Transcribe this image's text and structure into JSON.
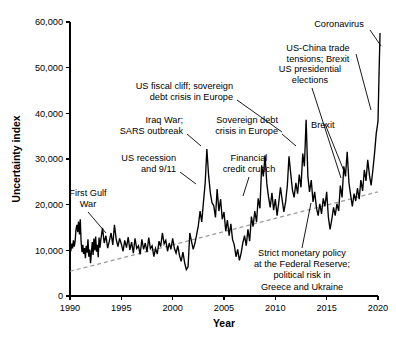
{
  "chart_data": {
    "type": "line",
    "title": "",
    "xlabel": "Year",
    "ylabel": "Uncertainty index",
    "xlim": [
      1990,
      2020
    ],
    "ylim": [
      0,
      60000
    ],
    "grid": false,
    "legend_position": "none",
    "x_ticks": [
      "1990",
      "1995",
      "2000",
      "2005",
      "2010",
      "2015",
      "2020"
    ],
    "y_ticks": [
      "0",
      "10,000",
      "20,000",
      "30,000",
      "40,000",
      "50,000",
      "60,000"
    ],
    "series": [
      {
        "name": "Uncertainty index",
        "style": "solid-black",
        "x": [
          1990.0,
          1990.08,
          1990.17,
          1990.25,
          1990.33,
          1990.42,
          1990.5,
          1990.58,
          1990.67,
          1990.75,
          1990.83,
          1990.92,
          1991.0,
          1991.08,
          1991.17,
          1991.25,
          1991.33,
          1991.42,
          1991.5,
          1991.58,
          1991.67,
          1991.75,
          1991.83,
          1991.92,
          1992.0,
          1992.08,
          1992.17,
          1992.25,
          1992.33,
          1992.42,
          1992.5,
          1992.58,
          1992.67,
          1992.75,
          1992.83,
          1992.92,
          1993.0,
          1993.17,
          1993.33,
          1993.5,
          1993.67,
          1993.83,
          1994.0,
          1994.17,
          1994.33,
          1994.5,
          1994.67,
          1994.83,
          1995.0,
          1995.17,
          1995.33,
          1995.5,
          1995.67,
          1995.83,
          1996.0,
          1996.17,
          1996.33,
          1996.5,
          1996.67,
          1996.83,
          1997.0,
          1997.17,
          1997.33,
          1997.5,
          1997.67,
          1997.83,
          1998.0,
          1998.17,
          1998.33,
          1998.5,
          1998.67,
          1998.83,
          1999.0,
          1999.17,
          1999.33,
          1999.5,
          1999.67,
          1999.83,
          2000.0,
          2000.17,
          2000.33,
          2000.5,
          2000.67,
          2000.83,
          2001.0,
          2001.17,
          2001.33,
          2001.5,
          2001.67,
          2001.83,
          2002.0,
          2002.17,
          2002.33,
          2002.5,
          2002.67,
          2002.83,
          2003.0,
          2003.17,
          2003.33,
          2003.5,
          2003.67,
          2003.83,
          2004.0,
          2004.17,
          2004.33,
          2004.5,
          2004.67,
          2004.83,
          2005.0,
          2005.17,
          2005.33,
          2005.5,
          2005.67,
          2005.83,
          2006.0,
          2006.17,
          2006.33,
          2006.5,
          2006.67,
          2006.83,
          2007.0,
          2007.17,
          2007.33,
          2007.5,
          2007.67,
          2007.83,
          2008.0,
          2008.17,
          2008.33,
          2008.5,
          2008.67,
          2008.83,
          2009.0,
          2009.17,
          2009.33,
          2009.5,
          2009.67,
          2009.83,
          2010.0,
          2010.17,
          2010.33,
          2010.5,
          2010.67,
          2010.83,
          2011.0,
          2011.17,
          2011.33,
          2011.5,
          2011.67,
          2011.83,
          2012.0,
          2012.17,
          2012.33,
          2012.5,
          2012.67,
          2012.83,
          2013.0,
          2013.17,
          2013.33,
          2013.5,
          2013.67,
          2013.83,
          2014.0,
          2014.17,
          2014.33,
          2014.5,
          2014.67,
          2014.83,
          2015.0,
          2015.17,
          2015.33,
          2015.5,
          2015.67,
          2015.83,
          2016.0,
          2016.17,
          2016.33,
          2016.5,
          2016.67,
          2016.83,
          2017.0,
          2017.17,
          2017.33,
          2017.5,
          2017.67,
          2017.83,
          2018.0,
          2018.17,
          2018.33,
          2018.5,
          2018.67,
          2018.83,
          2019.0,
          2019.17,
          2019.33,
          2019.5,
          2019.67,
          2019.83,
          2020.0,
          2020.1,
          2020.2
        ],
        "values": [
          11200,
          9800,
          11500,
          10400,
          12200,
          10800,
          12000,
          14500,
          15600,
          14000,
          16300,
          13500,
          16800,
          12000,
          9600,
          11200,
          9200,
          10500,
          8300,
          11000,
          9500,
          12400,
          8600,
          10200,
          7200,
          9400,
          11800,
          9000,
          12600,
          10000,
          13000,
          9700,
          11200,
          8500,
          12800,
          10600,
          12300,
          14900,
          11600,
          13200,
          10500,
          12000,
          13800,
          11200,
          15600,
          12400,
          10800,
          12600,
          11400,
          9800,
          12200,
          10600,
          12900,
          10100,
          11800,
          9400,
          12600,
          10400,
          11000,
          9100,
          12400,
          10200,
          11600,
          9600,
          12800,
          10400,
          11000,
          8600,
          10400,
          9200,
          12000,
          10800,
          13800,
          11400,
          12200,
          9800,
          11600,
          10200,
          12600,
          10400,
          9400,
          11000,
          8800,
          7600,
          9600,
          7200,
          5800,
          6400,
          13800,
          12000,
          10200,
          11600,
          13400,
          15400,
          18600,
          16200,
          20600,
          24800,
          32200,
          26400,
          22600,
          20400,
          19800,
          17200,
          23400,
          18600,
          21200,
          16800,
          18400,
          14200,
          16600,
          13200,
          15800,
          12400,
          11200,
          8600,
          10200,
          7800,
          9400,
          11600,
          13200,
          11000,
          14600,
          12000,
          17400,
          15200,
          18600,
          16200,
          21400,
          19200,
          28600,
          26200,
          30800,
          24600,
          21800,
          19400,
          22600,
          18800,
          21200,
          17600,
          20400,
          23800,
          21000,
          18400,
          20600,
          24200,
          30600,
          26800,
          23200,
          21600,
          24800,
          22400,
          26600,
          23800,
          31200,
          28400,
          38600,
          26200,
          22800,
          25400,
          20600,
          22800,
          19400,
          17600,
          20200,
          18000,
          21400,
          19600,
          22800,
          17200,
          14600,
          16800,
          19400,
          17600,
          20200,
          18600,
          24200,
          21600,
          28400,
          26200,
          31600,
          24800,
          22200,
          19600,
          22400,
          20800,
          23600,
          21200,
          25400,
          23000,
          27600,
          25200,
          29800,
          26400,
          24200,
          27600,
          31400,
          35600,
          38200,
          48600,
          57600
        ]
      },
      {
        "name": "Trend",
        "style": "dashed-grey",
        "x": [
          1990,
          2020
        ],
        "values": [
          5400,
          22800
        ]
      }
    ],
    "annotations": [
      {
        "id": "first-gulf-war",
        "text_lines": [
          "First Gulf",
          "War"
        ],
        "align": "center",
        "text_x": 88,
        "text_y": 196,
        "leader": [
          [
            88,
            212
          ],
          [
            106,
            233
          ]
        ]
      },
      {
        "id": "us-recession-911",
        "text_lines": [
          "US recession",
          "and 9/11"
        ],
        "align": "right",
        "text_x": 176,
        "text_y": 161,
        "leader": [
          [
            180,
            172
          ],
          [
            196,
            184
          ]
        ]
      },
      {
        "id": "iraq-war-sars",
        "text_lines": [
          "Iraq War;",
          "SARS outbreak"
        ],
        "align": "right",
        "text_x": 183,
        "text_y": 123,
        "leader": [
          [
            187,
            134
          ],
          [
            201,
            146
          ]
        ]
      },
      {
        "id": "financial-credit-crunch",
        "text_lines": [
          "Financial",
          "credit crunch"
        ],
        "align": "center",
        "text_x": 249,
        "text_y": 161,
        "leader": [
          [
            249,
            177
          ],
          [
            243,
            196
          ]
        ]
      },
      {
        "id": "us-fiscal-cliff",
        "text_lines": [
          "US fiscal cliff; sovereign",
          "debt crisis in Europe"
        ],
        "align": "right",
        "text_x": 233,
        "text_y": 89,
        "leader": [
          [
            237,
            100
          ],
          [
            282,
            132
          ]
        ]
      },
      {
        "id": "sovereign-debt-europe",
        "text_lines": [
          "Sovereign debt",
          "crisis in Europe"
        ],
        "align": "right",
        "text_x": 278,
        "text_y": 123,
        "leader": [
          [
            282,
            134
          ],
          [
            296,
            146
          ]
        ]
      },
      {
        "id": "us-presidential",
        "text_lines": [
          "US presidential",
          "elections"
        ],
        "align": "center",
        "text_x": 310,
        "text_y": 72,
        "leader": [
          [
            312,
            88
          ],
          [
            341,
            178
          ]
        ]
      },
      {
        "id": "brexit-2016",
        "text_lines": [
          "Brexit"
        ],
        "align": "left",
        "text_x": 311,
        "text_y": 128,
        "leader": [
          [
            325,
            124
          ],
          [
            346,
            176
          ]
        ]
      },
      {
        "id": "us-china-trade",
        "text_lines": [
          "US-China trade",
          "tensions; Brexit"
        ],
        "align": "center",
        "text_x": 318,
        "text_y": 51,
        "leader": [
          [
            356,
            54
          ],
          [
            371,
            110
          ]
        ]
      },
      {
        "id": "coronavirus",
        "text_lines": [
          "Coronavirus"
        ],
        "align": "center",
        "text_x": 339,
        "text_y": 27,
        "leader": [
          [
            370,
            30
          ],
          [
            381,
            46
          ]
        ]
      },
      {
        "id": "strict-monetary-policy",
        "text_lines": [
          "Strict monetary policy",
          "at the Federal Reserve;",
          "political risk in",
          "Greece and Ukraine"
        ],
        "align": "center",
        "text_x": 302,
        "text_y": 256,
        "leader": [
          [
            302,
            248
          ],
          [
            311,
            203
          ]
        ]
      }
    ]
  },
  "geometry": {
    "plot_left": 70,
    "plot_right": 378,
    "plot_top": 22,
    "plot_bottom": 296
  }
}
